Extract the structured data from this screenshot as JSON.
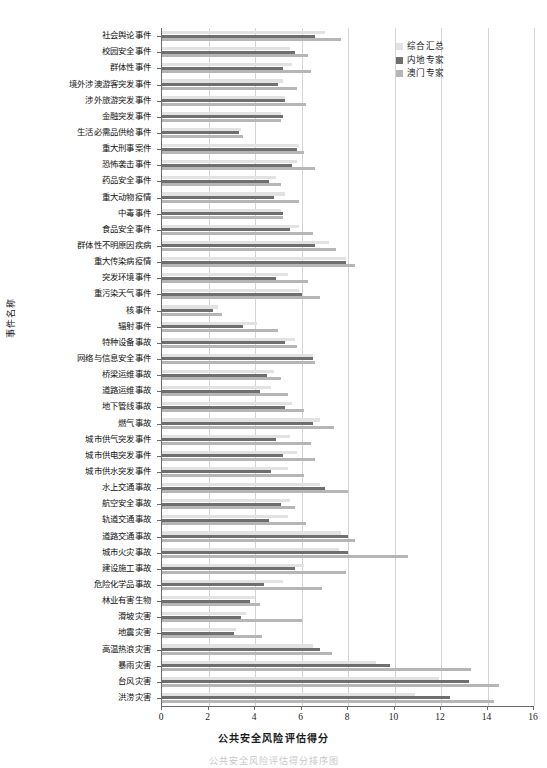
{
  "chart_data": {
    "type": "bar",
    "orientation": "horizontal",
    "title": "",
    "xlabel": "公共安全风险评估得分",
    "ylabel": "事件名称",
    "xlim": [
      0,
      16
    ],
    "xticks": [
      0,
      2,
      4,
      6,
      8,
      10,
      12,
      14,
      16
    ],
    "grid": "vertical",
    "legend_position": "top-right",
    "colors": {
      "综合汇总": "#e2e2e2",
      "内地专家": "#6f6f6f",
      "澳门专家": "#b6b6b6"
    },
    "categories": [
      "社会舆论事件",
      "校园安全事件",
      "群体性事件",
      "境外涉澳游客突发事件",
      "涉外旅游突发事件",
      "金融突发事件",
      "生活必需品供给事件",
      "重大刑事案件",
      "恐怖袭击事件",
      "药品安全事件",
      "重大动物疫情",
      "中毒事件",
      "食品安全事件",
      "群体性不明原因疾病",
      "重大传染病疫情",
      "突发环境事件",
      "重污染天气事件",
      "核事件",
      "辐射事件",
      "特种设备事故",
      "网络与信息安全事件",
      "桥梁运维事故",
      "道路运维事故",
      "地下管线事故",
      "燃气事故",
      "城市供气突发事件",
      "城市供电突发事件",
      "城市供水突发事件",
      "水上交通事故",
      "航空安全事故",
      "轨道交通事故",
      "道路交通事故",
      "城市火灾事故",
      "建设施工事故",
      "危险化学品事故",
      "林业有害生物",
      "滑坡灾害",
      "地震灾害",
      "高温热浪灾害",
      "暴雨灾害",
      "台风灾害",
      "洪涝灾害"
    ],
    "series": [
      {
        "name": "综合汇总",
        "values": [
          7.0,
          5.5,
          5.6,
          5.2,
          5.3,
          5.1,
          3.4,
          5.9,
          5.8,
          4.9,
          5.3,
          5.1,
          5.9,
          7.2,
          7.9,
          5.4,
          5.9,
          2.4,
          4.1,
          5.7,
          6.5,
          4.8,
          4.7,
          5.6,
          6.8,
          5.5,
          5.8,
          5.4,
          6.8,
          5.5,
          5.4,
          7.7,
          7.6,
          6.1,
          5.2,
          4.0,
          3.6,
          3.2,
          6.5,
          9.2,
          11.9,
          10.9
        ],
        "color": "#e2e2e2"
      },
      {
        "name": "内地专家",
        "values": [
          6.6,
          5.7,
          5.2,
          5.0,
          5.3,
          5.2,
          3.3,
          5.8,
          5.6,
          4.6,
          4.8,
          5.2,
          5.5,
          6.6,
          7.9,
          4.9,
          6.0,
          2.2,
          3.5,
          5.3,
          6.5,
          4.5,
          4.2,
          5.3,
          6.5,
          4.9,
          5.2,
          4.7,
          7.0,
          5.1,
          4.6,
          8.0,
          8.0,
          5.7,
          4.4,
          3.8,
          3.4,
          3.1,
          6.8,
          9.8,
          13.2,
          12.4
        ],
        "color": "#6f6f6f"
      },
      {
        "name": "澳门专家",
        "values": [
          7.7,
          6.3,
          6.4,
          5.8,
          6.2,
          5.1,
          3.5,
          6.1,
          6.6,
          5.1,
          5.9,
          5.2,
          6.5,
          7.5,
          8.3,
          6.3,
          6.8,
          2.6,
          5.0,
          5.8,
          6.6,
          5.1,
          5.4,
          6.1,
          7.4,
          6.4,
          6.6,
          6.1,
          8.0,
          5.7,
          6.2,
          8.3,
          10.6,
          7.9,
          6.9,
          4.2,
          6.0,
          4.3,
          7.3,
          13.3,
          14.5,
          14.3
        ],
        "color": "#b6b6b6"
      }
    ]
  },
  "legend": {
    "items": [
      {
        "label": "综合汇总",
        "color": "#e2e2e2"
      },
      {
        "label": "内地专家",
        "color": "#6f6f6f"
      },
      {
        "label": "澳门专家",
        "color": "#b6b6b6"
      }
    ]
  },
  "axes": {
    "x_title": "公共安全风险评估得分",
    "y_title": "事件名称",
    "x_ticks": [
      "0",
      "2",
      "4",
      "6",
      "8",
      "10",
      "12",
      "14",
      "16"
    ]
  },
  "caption": "公共安全风险评估得分排序图"
}
